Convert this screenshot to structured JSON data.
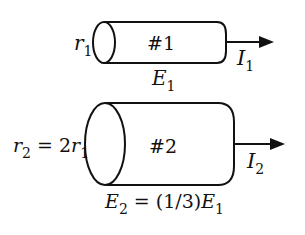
{
  "diagram": {
    "cylinder1": {
      "label": "#1",
      "radius_label": "r",
      "radius_sub": "1",
      "field_label": "E",
      "field_sub": "1",
      "current_label": "I",
      "current_sub": "1"
    },
    "cylinder2": {
      "label": "#2",
      "radius_label_parts": [
        "r",
        "2",
        " = 2",
        "r",
        "1"
      ],
      "field_label_parts": [
        "E",
        "2",
        " = (1/3)",
        "E",
        "1"
      ],
      "current_label": "I",
      "current_sub": "2"
    },
    "colors": {
      "stroke": "#111111",
      "background": "#ffffff"
    }
  }
}
